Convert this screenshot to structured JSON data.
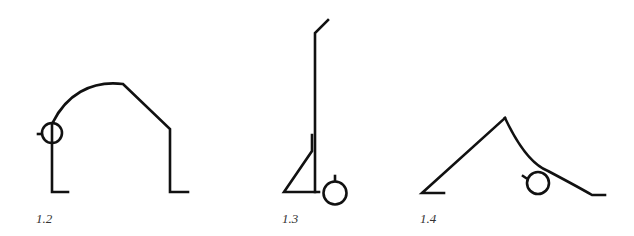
{
  "figures": [
    {
      "id": "fig-1-2",
      "label": "1.2",
      "description": "figure bending forward in an arch, hands on floor"
    },
    {
      "id": "fig-1-3",
      "label": "1.3",
      "description": "figure standing upright with one leg bent, head low at floor"
    },
    {
      "id": "fig-1-4",
      "label": "1.4",
      "description": "figure in inverted V pose with head near floor"
    }
  ],
  "colors": {
    "stroke": "#111111",
    "label": "#333333",
    "background": "#ffffff"
  }
}
